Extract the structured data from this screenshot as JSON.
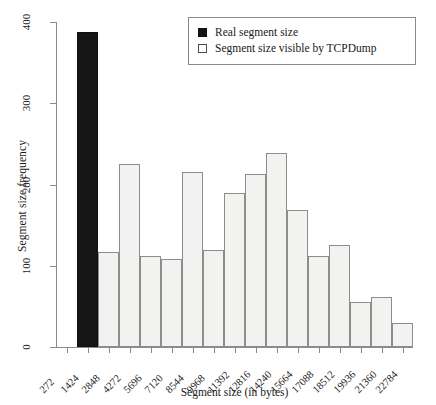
{
  "chart_data": {
    "type": "bar",
    "title": "",
    "subtitle": "",
    "xlabel": "Segment size (in bytes)",
    "ylabel": "Segment size frequency",
    "xlim": [
      0,
      17
    ],
    "ylim": [
      0,
      400
    ],
    "yticks": [
      0,
      100,
      200,
      300,
      400
    ],
    "grid": false,
    "legend_position": "top-right",
    "categories": [
      "272",
      "1424",
      "2848",
      "4272",
      "5696",
      "7120",
      "8544",
      "9968",
      "11392",
      "12816",
      "14240",
      "15664",
      "17088",
      "18512",
      "19936",
      "21360",
      "22784"
    ],
    "bars": [
      {
        "category": "272",
        "value": 0,
        "series": "Segment size visible by TCPDump"
      },
      {
        "category": "1424",
        "value": 388,
        "series": "Real segment size"
      },
      {
        "category": "2848",
        "value": 117,
        "series": "Segment size visible by TCPDump"
      },
      {
        "category": "4272",
        "value": 225,
        "series": "Segment size visible by TCPDump"
      },
      {
        "category": "5696",
        "value": 112,
        "series": "Segment size visible by TCPDump"
      },
      {
        "category": "7120",
        "value": 108,
        "series": "Segment size visible by TCPDump"
      },
      {
        "category": "8544",
        "value": 215,
        "series": "Segment size visible by TCPDump"
      },
      {
        "category": "9968",
        "value": 120,
        "series": "Segment size visible by TCPDump"
      },
      {
        "category": "11392",
        "value": 190,
        "series": "Segment size visible by TCPDump"
      },
      {
        "category": "12816",
        "value": 213,
        "series": "Segment size visible by TCPDump"
      },
      {
        "category": "14240",
        "value": 239,
        "series": "Segment size visible by TCPDump"
      },
      {
        "category": "15664",
        "value": 169,
        "series": "Segment size visible by TCPDump"
      },
      {
        "category": "17088",
        "value": 112,
        "series": "Segment size visible by TCPDump"
      },
      {
        "category": "18512",
        "value": 126,
        "series": "Segment size visible by TCPDump"
      },
      {
        "category": "19936",
        "value": 56,
        "series": "Segment size visible by TCPDump"
      },
      {
        "category": "21360",
        "value": 62,
        "series": "Segment size visible by TCPDump"
      },
      {
        "category": "22784",
        "value": 29,
        "series": "Segment size visible by TCPDump"
      }
    ],
    "series": [
      {
        "name": "Real segment size",
        "color": "#151515"
      },
      {
        "name": "Segment size visible by TCPDump",
        "color": "#f2f2f0"
      }
    ]
  },
  "legend": {
    "items": [
      {
        "label": "Real segment size",
        "style": "dark"
      },
      {
        "label": "Segment size visible by TCPDump",
        "style": "light"
      }
    ]
  },
  "colors": {
    "real_segment": "#151515",
    "tcpdump_segment": "#f2f2f0",
    "axis": "#8a8a8a",
    "text": "#1a1a1a",
    "background": "#ffffff"
  }
}
